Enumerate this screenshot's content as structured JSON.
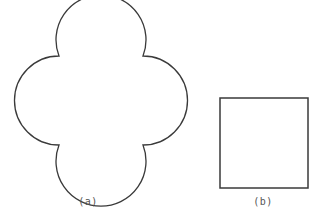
{
  "figures": [
    {
      "id": "a",
      "label": "(a)",
      "shape": "four-lobed curved outline",
      "stroke": "#3a3a3a"
    },
    {
      "id": "b",
      "label": "(b)",
      "shape": "square",
      "stroke": "#3a3a3a"
    }
  ]
}
